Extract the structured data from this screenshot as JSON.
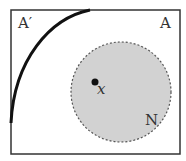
{
  "labels": {
    "complement": "A′",
    "set": "A",
    "point": "x",
    "neighborhood": "N"
  },
  "colors": {
    "border": "#333333",
    "curve": "#111111",
    "circle_fill": "#d2d2d2",
    "circle_border": "#555555"
  }
}
